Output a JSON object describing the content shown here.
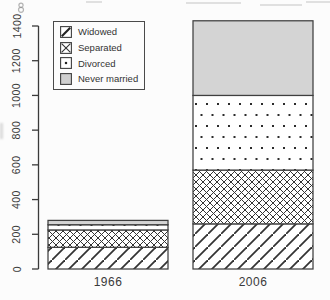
{
  "chart_data": {
    "type": "bar",
    "stacked": true,
    "title": "",
    "xlabel": "",
    "ylabel": "",
    "categories": [
      "1966",
      "2006"
    ],
    "series": [
      {
        "name": "Widowed",
        "pattern": "diagonal-hatch",
        "values": [
          125,
          260
        ]
      },
      {
        "name": "Separated",
        "pattern": "cross-hatch",
        "values": [
          100,
          310
        ]
      },
      {
        "name": "Divorced",
        "pattern": "dots",
        "values": [
          30,
          430
        ]
      },
      {
        "name": "Never married",
        "pattern": "solid-gray",
        "values": [
          25,
          430
        ]
      }
    ],
    "totals": [
      280,
      1430
    ],
    "ylim": [
      0,
      1400
    ],
    "yticks": [
      0,
      200,
      400,
      600,
      800,
      1000,
      1200,
      1400
    ],
    "grid": false,
    "legend_position": "top-left",
    "colors": {
      "bar_outline": "#3f3f3f",
      "hatch": "#333333",
      "never_married_fill": "#d4d4d4",
      "background": "#fcfcfc",
      "text": "#3a3a3a"
    }
  },
  "legend": {
    "items": [
      {
        "label": "Widowed",
        "swatch": "diagonal-hatch-icon"
      },
      {
        "label": "Separated",
        "swatch": "cross-hatch-icon"
      },
      {
        "label": "Divorced",
        "swatch": "dot-icon"
      },
      {
        "label": "Never married",
        "swatch": "gray-fill-icon"
      }
    ]
  }
}
